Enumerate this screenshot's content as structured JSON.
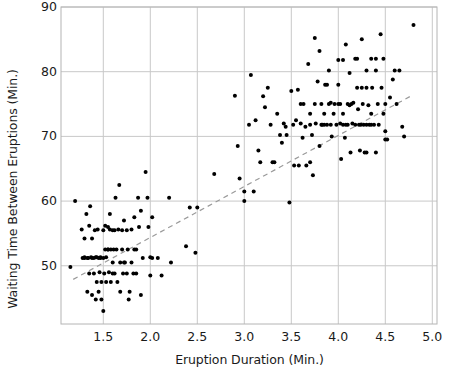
{
  "chart_data": {
    "type": "scatter",
    "title": "",
    "xlabel": "Eruption Duration (Min.)",
    "ylabel": "Waiting Time Between Eruptions (Min.)",
    "xlim": [
      1.05,
      5.05
    ],
    "ylim": [
      41.0,
      90.0
    ],
    "xticks": [
      "1.5",
      "2.0",
      "2.5",
      "3.0",
      "3.5",
      "4.0",
      "4.5",
      "5.0"
    ],
    "xtick_values": [
      1.5,
      2.0,
      2.5,
      3.0,
      3.5,
      4.0,
      4.5,
      5.0
    ],
    "yticks": [
      "50",
      "60",
      "70",
      "80",
      "90"
    ],
    "ytick_values": [
      50,
      60,
      70,
      80,
      90
    ],
    "grid": true,
    "legend": "none",
    "marker_color": "#000000",
    "marker_size_px": 4,
    "grid_color": "#c8c8c8",
    "axes_color": "#b4b4b4",
    "background": "#ffffff",
    "trendline": {
      "style": "dashed",
      "color": "#9a9a9a",
      "x0": 1.18,
      "y0": 47.9,
      "x1": 4.78,
      "y1": 76.3
    },
    "series": [
      {
        "name": "Old Faithful eruptions",
        "points": [
          [
            1.15,
            49.8
          ],
          [
            1.2,
            60.0
          ],
          [
            1.27,
            55.6
          ],
          [
            1.28,
            51.2
          ],
          [
            1.3,
            54.2
          ],
          [
            1.3,
            51.3
          ],
          [
            1.32,
            58.0
          ],
          [
            1.33,
            46.0
          ],
          [
            1.34,
            51.2
          ],
          [
            1.35,
            48.8
          ],
          [
            1.35,
            56.2
          ],
          [
            1.36,
            59.2
          ],
          [
            1.37,
            51.3
          ],
          [
            1.38,
            54.2
          ],
          [
            1.38,
            45.5
          ],
          [
            1.4,
            51.2
          ],
          [
            1.4,
            48.8
          ],
          [
            1.41,
            55.5
          ],
          [
            1.42,
            44.8
          ],
          [
            1.43,
            51.3
          ],
          [
            1.43,
            47.5
          ],
          [
            1.44,
            55.6
          ],
          [
            1.45,
            51.2
          ],
          [
            1.45,
            46.0
          ],
          [
            1.46,
            49.0
          ],
          [
            1.47,
            51.3
          ],
          [
            1.48,
            44.8
          ],
          [
            1.48,
            47.5
          ],
          [
            1.5,
            51.2
          ],
          [
            1.5,
            55.5
          ],
          [
            1.5,
            43.0
          ],
          [
            1.51,
            48.8
          ],
          [
            1.52,
            52.5
          ],
          [
            1.52,
            56.2
          ],
          [
            1.53,
            51.3
          ],
          [
            1.53,
            47.5
          ],
          [
            1.55,
            52.5
          ],
          [
            1.55,
            56.0
          ],
          [
            1.56,
            49.0
          ],
          [
            1.57,
            58.0
          ],
          [
            1.58,
            52.5
          ],
          [
            1.58,
            47.5
          ],
          [
            1.6,
            55.5
          ],
          [
            1.6,
            50.5
          ],
          [
            1.61,
            52.5
          ],
          [
            1.62,
            48.8
          ],
          [
            1.63,
            60.5
          ],
          [
            1.64,
            52.5
          ],
          [
            1.65,
            47.5
          ],
          [
            1.66,
            55.6
          ],
          [
            1.67,
            62.5
          ],
          [
            1.68,
            50.5
          ],
          [
            1.68,
            46.0
          ],
          [
            1.7,
            55.5
          ],
          [
            1.7,
            52.5
          ],
          [
            1.71,
            48.8
          ],
          [
            1.72,
            57.0
          ],
          [
            1.73,
            50.5
          ],
          [
            1.75,
            55.5
          ],
          [
            1.75,
            48.8
          ],
          [
            1.76,
            52.5
          ],
          [
            1.77,
            44.8
          ],
          [
            1.78,
            46.0
          ],
          [
            1.8,
            55.6
          ],
          [
            1.8,
            50.5
          ],
          [
            1.82,
            48.8
          ],
          [
            1.83,
            57.5
          ],
          [
            1.83,
            52.5
          ],
          [
            1.85,
            48.8
          ],
          [
            1.87,
            60.5
          ],
          [
            1.88,
            56.0
          ],
          [
            1.9,
            58.5
          ],
          [
            1.9,
            45.5
          ],
          [
            1.92,
            51.2
          ],
          [
            1.95,
            64.5
          ],
          [
            1.97,
            60.5
          ],
          [
            1.98,
            56.0
          ],
          [
            2.0,
            51.3
          ],
          [
            2.0,
            48.5
          ],
          [
            2.02,
            57.5
          ],
          [
            2.08,
            51.2
          ],
          [
            2.12,
            48.5
          ],
          [
            2.2,
            60.5
          ],
          [
            2.22,
            50.5
          ],
          [
            2.38,
            53.0
          ],
          [
            2.42,
            59.0
          ],
          [
            2.48,
            52.0
          ],
          [
            2.5,
            59.0
          ],
          [
            2.68,
            64.2
          ],
          [
            2.9,
            76.3
          ],
          [
            2.93,
            68.5
          ],
          [
            2.95,
            63.5
          ],
          [
            3.0,
            61.5
          ],
          [
            3.0,
            60.0
          ],
          [
            3.05,
            71.8
          ],
          [
            3.07,
            79.5
          ],
          [
            3.1,
            61.5
          ],
          [
            3.12,
            72.5
          ],
          [
            3.15,
            67.8
          ],
          [
            3.2,
            76.2
          ],
          [
            3.22,
            74.5
          ],
          [
            3.25,
            77.5
          ],
          [
            3.28,
            71.8
          ],
          [
            3.3,
            66.0
          ],
          [
            3.32,
            66.0
          ],
          [
            3.35,
            73.5
          ],
          [
            3.38,
            70.2
          ],
          [
            3.4,
            69.0
          ],
          [
            3.42,
            72.0
          ],
          [
            3.45,
            70.2
          ],
          [
            3.48,
            59.8
          ],
          [
            3.5,
            77.0
          ],
          [
            3.52,
            71.8
          ],
          [
            3.53,
            65.5
          ],
          [
            3.55,
            72.5
          ],
          [
            3.57,
            77.2
          ],
          [
            3.58,
            65.5
          ],
          [
            3.6,
            72.0
          ],
          [
            3.62,
            69.8
          ],
          [
            3.63,
            75.0
          ],
          [
            3.65,
            71.5
          ],
          [
            3.66,
            65.5
          ],
          [
            3.68,
            81.2
          ],
          [
            3.7,
            73.5
          ],
          [
            3.72,
            70.2
          ],
          [
            3.73,
            64.0
          ],
          [
            3.75,
            85.2
          ],
          [
            3.75,
            75.0
          ],
          [
            3.76,
            72.0
          ],
          [
            3.78,
            78.5
          ],
          [
            3.8,
            68.5
          ],
          [
            3.8,
            83.2
          ],
          [
            3.82,
            75.0
          ],
          [
            3.83,
            71.8
          ],
          [
            3.85,
            73.5
          ],
          [
            3.86,
            78.0
          ],
          [
            3.88,
            78.0
          ],
          [
            3.9,
            80.2
          ],
          [
            3.9,
            75.0
          ],
          [
            3.92,
            71.8
          ],
          [
            3.93,
            70.0
          ],
          [
            3.95,
            73.5
          ],
          [
            3.96,
            75.0
          ],
          [
            3.98,
            71.8
          ],
          [
            4.0,
            78.0
          ],
          [
            4.0,
            81.8
          ],
          [
            4.0,
            75.0
          ],
          [
            4.02,
            72.0
          ],
          [
            4.03,
            66.5
          ],
          [
            4.05,
            81.8
          ],
          [
            4.05,
            73.5
          ],
          [
            4.07,
            69.8
          ],
          [
            4.08,
            84.2
          ],
          [
            4.1,
            75.0
          ],
          [
            4.1,
            71.8
          ],
          [
            4.12,
            79.8
          ],
          [
            4.13,
            67.5
          ],
          [
            4.15,
            72.0
          ],
          [
            4.16,
            75.2
          ],
          [
            4.18,
            82.0
          ],
          [
            4.18,
            71.8
          ],
          [
            4.2,
            82.0
          ],
          [
            4.2,
            77.5
          ],
          [
            4.21,
            74.2
          ],
          [
            4.22,
            71.8
          ],
          [
            4.23,
            67.8
          ],
          [
            4.25,
            85.0
          ],
          [
            4.25,
            77.5
          ],
          [
            4.26,
            75.0
          ],
          [
            4.27,
            71.8
          ],
          [
            4.28,
            67.5
          ],
          [
            4.3,
            80.2
          ],
          [
            4.3,
            77.5
          ],
          [
            4.32,
            74.8
          ],
          [
            4.33,
            71.8
          ],
          [
            4.35,
            82.0
          ],
          [
            4.35,
            73.5
          ],
          [
            4.36,
            77.5
          ],
          [
            4.38,
            71.8
          ],
          [
            4.4,
            82.0
          ],
          [
            4.4,
            80.2
          ],
          [
            4.4,
            67.5
          ],
          [
            4.42,
            75.0
          ],
          [
            4.43,
            71.8
          ],
          [
            4.45,
            85.8
          ],
          [
            4.46,
            77.5
          ],
          [
            4.48,
            82.0
          ],
          [
            4.48,
            73.5
          ],
          [
            4.5,
            75.0
          ],
          [
            4.5,
            70.8
          ],
          [
            4.5,
            69.5
          ],
          [
            4.52,
            69.5
          ],
          [
            4.55,
            76.0
          ],
          [
            4.58,
            78.8
          ],
          [
            4.6,
            80.2
          ],
          [
            4.62,
            75.0
          ],
          [
            4.65,
            80.2
          ],
          [
            4.68,
            71.5
          ],
          [
            4.7,
            70.0
          ],
          [
            4.8,
            87.2
          ],
          [
            3.17,
            66.0
          ],
          [
            3.44,
            71.5
          ],
          [
            3.7,
            66.0
          ],
          [
            3.85,
            71.8
          ],
          [
            4.08,
            71.8
          ],
          [
            4.12,
            74.8
          ],
          [
            4.24,
            71.8
          ],
          [
            4.3,
            71.8
          ],
          [
            1.42,
            51.3
          ],
          [
            1.47,
            51.2
          ],
          [
            1.55,
            52.5
          ],
          [
            1.57,
            55.6
          ],
          [
            1.62,
            55.5
          ],
          [
            1.3,
            51.2
          ],
          [
            1.33,
            51.2
          ],
          [
            3.6,
            75.0
          ],
          [
            3.92,
            75.2
          ],
          [
            4.02,
            75.0
          ],
          [
            4.14,
            75.0
          ],
          [
            3.7,
            71.8
          ],
          [
            3.82,
            71.8
          ],
          [
            4.05,
            71.8
          ],
          [
            4.3,
            67.5
          ],
          [
            4.35,
            71.8
          ],
          [
            3.88,
            71.8
          ],
          [
            1.38,
            51.2
          ],
          [
            1.6,
            48.8
          ],
          [
            1.85,
            52.5
          ],
          [
            2.02,
            51.2
          ],
          [
            1.72,
            50.5
          ]
        ]
      }
    ]
  }
}
